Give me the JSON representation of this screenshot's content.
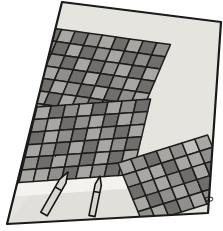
{
  "scene": {
    "title": "Solar panel array illustration",
    "style": "hand-drawn grayscale sketch",
    "canvas": {
      "width": 223,
      "height": 231
    },
    "background_color": "#ffffff"
  },
  "frame": {
    "name": "tilted-photo-border",
    "stroke_color": "#1a1a1a",
    "stroke_width": 2.2,
    "fill_color": "#e9e7e2",
    "corners": [
      {
        "x": 62,
        "y": 2
      },
      {
        "x": 221,
        "y": 22
      },
      {
        "x": 208,
        "y": 213
      },
      {
        "x": 7,
        "y": 224
      }
    ]
  },
  "ground": {
    "name": "ground-plane",
    "fill_color": "#e6e4df",
    "shadow_color": "#cfccc6"
  },
  "palette": {
    "cell_light": "#a9a7a3",
    "cell_mid": "#918f8b",
    "cell_dark": "#6f6d6a",
    "cell_darker": "#5d5b58",
    "cell_pale": "#c2c0bc",
    "grid_line": "#1f1f1f",
    "walkway": "#f2f0ec",
    "walkway_shade": "#d6d3cd",
    "post_body": "#d8d6d1",
    "post_shade": "#a6a39e",
    "outline": "#141414"
  },
  "panels": [
    {
      "name": "panel-array-upper",
      "label": "Upper solar panel array",
      "rows": 7,
      "cols": 14,
      "cells": [
        [
          "dark",
          "light",
          "dark",
          "light",
          "mid",
          "dark",
          "light",
          "dark",
          "mid",
          "light",
          "dark",
          "light",
          "dark",
          "mid"
        ],
        [
          "light",
          "mid",
          "light",
          "dark",
          "light",
          "mid",
          "dark",
          "light",
          "dark",
          "mid",
          "light",
          "dark",
          "mid",
          "dark"
        ],
        [
          "dark",
          "light",
          "mid",
          "light",
          "dark",
          "light",
          "mid",
          "dark",
          "light",
          "dark",
          "mid",
          "light",
          "dark",
          "light"
        ],
        [
          "mid",
          "dark",
          "light",
          "mid",
          "light",
          "dark",
          "light",
          "mid",
          "dark",
          "light",
          "dark",
          "mid",
          "light",
          "dark"
        ],
        [
          "light",
          "dark",
          "mid",
          "dark",
          "light",
          "mid",
          "dark",
          "light",
          "mid",
          "dark",
          "light",
          "dark",
          "mid",
          "light"
        ],
        [
          "dark",
          "light",
          "dark",
          "light",
          "mid",
          "dark",
          "light",
          "dark",
          "light",
          "mid",
          "dark",
          "light",
          "dark",
          "mid"
        ],
        [
          "mid",
          "dark",
          "light",
          "dark",
          "light",
          "light",
          "mid",
          "dark",
          "light",
          "dark",
          "mid",
          "light",
          "dark",
          "light"
        ]
      ]
    },
    {
      "name": "panel-array-middle",
      "label": "Middle solar panel array",
      "rows": 6,
      "cols": 13,
      "cells": [
        [
          "light",
          "dark",
          "light",
          "mid",
          "dark",
          "light",
          "dark",
          "mid",
          "light",
          "dark",
          "light",
          "mid",
          "dark"
        ],
        [
          "dark",
          "light",
          "mid",
          "dark",
          "light",
          "mid",
          "light",
          "dark",
          "mid",
          "light",
          "dark",
          "light",
          "mid"
        ],
        [
          "mid",
          "dark",
          "light",
          "light",
          "mid",
          "dark",
          "light",
          "mid",
          "dark",
          "light",
          "mid",
          "dark",
          "light"
        ],
        [
          "light",
          "mid",
          "dark",
          "light",
          "dark",
          "light",
          "mid",
          "dark",
          "light",
          "dark",
          "light",
          "mid",
          "dark"
        ],
        [
          "dark",
          "light",
          "mid",
          "dark",
          "light",
          "mid",
          "dark",
          "light",
          "mid",
          "dark",
          "light",
          "dark",
          "light"
        ],
        [
          "light",
          "dark",
          "light",
          "mid",
          "dark",
          "light",
          "light",
          "mid",
          "dark",
          "light",
          "mid",
          "dark",
          "mid"
        ]
      ]
    },
    {
      "name": "panel-array-lower-right",
      "label": "Lower-right solar panel array",
      "rows": 5,
      "cols": 7,
      "cells": [
        [
          "light",
          "mid",
          "dark",
          "light",
          "mid",
          "pale",
          "light"
        ],
        [
          "mid",
          "light",
          "light",
          "dark",
          "light",
          "light",
          "mid"
        ],
        [
          "dark",
          "mid",
          "light",
          "mid",
          "dark",
          "light",
          "dark"
        ],
        [
          "light",
          "dark",
          "mid",
          "light",
          "mid",
          "dark",
          "light"
        ],
        [
          "mid",
          "light",
          "dark",
          "mid",
          "light",
          "mid",
          "dark"
        ]
      ]
    }
  ],
  "walkways": [
    {
      "name": "walkway-upper",
      "label": "Upper walkway strip"
    },
    {
      "name": "walkway-lower",
      "label": "Lower walkway strip"
    }
  ],
  "posts": [
    {
      "name": "post-left",
      "label": "Left marker post with conical tip"
    },
    {
      "name": "post-right",
      "label": "Right marker post with conical tip"
    }
  ],
  "mark": {
    "name": "edge-mark",
    "label": "Small dark mark at right border",
    "glyph": "0",
    "x": 205,
    "y": 196
  }
}
